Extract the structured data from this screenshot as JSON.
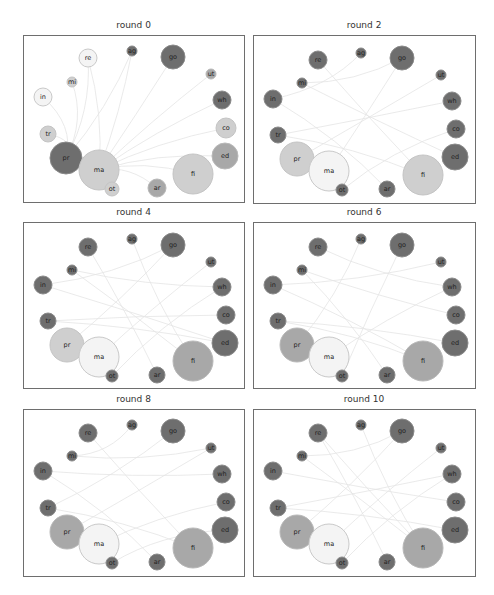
{
  "chart_data": {
    "type": "network-small-multiples",
    "title": "",
    "node_order": [
      "ag",
      "go",
      "ut",
      "wh",
      "co",
      "ed",
      "fi",
      "ar",
      "ot",
      "ma",
      "pr",
      "tr",
      "in",
      "mi",
      "re"
    ],
    "colors": {
      "dark": "#6e6e6e",
      "mid": "#a8a8a8",
      "light": "#cfcfcf",
      "white": "#f4f4f4"
    },
    "panels": [
      {
        "title": "round 0",
        "nodes": [
          {
            "id": "ag",
            "x": 108,
            "y": 15,
            "r": 5,
            "shade": "dark"
          },
          {
            "id": "go",
            "x": 149,
            "y": 21,
            "r": 12,
            "shade": "dark"
          },
          {
            "id": "re",
            "x": 64,
            "y": 22,
            "r": 9,
            "shade": "white"
          },
          {
            "id": "ut",
            "x": 187,
            "y": 38,
            "r": 5,
            "shade": "mid"
          },
          {
            "id": "mi",
            "x": 48,
            "y": 46,
            "r": 5,
            "shade": "light"
          },
          {
            "id": "in",
            "x": 19,
            "y": 61,
            "r": 9,
            "shade": "white"
          },
          {
            "id": "wh",
            "x": 198,
            "y": 64,
            "r": 9,
            "shade": "dark"
          },
          {
            "id": "co",
            "x": 202,
            "y": 92,
            "r": 10,
            "shade": "light"
          },
          {
            "id": "tr",
            "x": 24,
            "y": 98,
            "r": 8,
            "shade": "light"
          },
          {
            "id": "ed",
            "x": 201,
            "y": 120,
            "r": 13,
            "shade": "mid"
          },
          {
            "id": "pr",
            "x": 42,
            "y": 122,
            "r": 16,
            "shade": "dark"
          },
          {
            "id": "ma",
            "x": 75,
            "y": 134,
            "r": 20,
            "shade": "light"
          },
          {
            "id": "fi",
            "x": 169,
            "y": 138,
            "r": 20,
            "shade": "light"
          },
          {
            "id": "ot",
            "x": 88,
            "y": 153,
            "r": 7,
            "shade": "light"
          },
          {
            "id": "ar",
            "x": 133,
            "y": 152,
            "r": 9,
            "shade": "mid"
          }
        ],
        "edges": [
          [
            "pr",
            "re"
          ],
          [
            "pr",
            "in"
          ],
          [
            "pr",
            "mi"
          ],
          [
            "pr",
            "tr"
          ],
          [
            "ma",
            "ag"
          ],
          [
            "ma",
            "go"
          ],
          [
            "ma",
            "ut"
          ],
          [
            "ma",
            "wh"
          ],
          [
            "ma",
            "co"
          ],
          [
            "ma",
            "ed"
          ],
          [
            "ma",
            "fi"
          ],
          [
            "ma",
            "ar"
          ],
          [
            "ma",
            "ot"
          ],
          [
            "pr",
            "ag"
          ],
          [
            "ma",
            "re"
          ]
        ]
      },
      {
        "title": "round 2",
        "nodes": [
          {
            "id": "ag",
            "x": 107,
            "y": 17,
            "r": 5,
            "shade": "dark"
          },
          {
            "id": "go",
            "x": 148,
            "y": 22,
            "r": 12,
            "shade": "dark"
          },
          {
            "id": "re",
            "x": 64,
            "y": 24,
            "r": 9,
            "shade": "dark"
          },
          {
            "id": "ut",
            "x": 187,
            "y": 39,
            "r": 5,
            "shade": "dark"
          },
          {
            "id": "mi",
            "x": 48,
            "y": 47,
            "r": 5,
            "shade": "dark"
          },
          {
            "id": "in",
            "x": 19,
            "y": 63,
            "r": 9,
            "shade": "dark"
          },
          {
            "id": "wh",
            "x": 198,
            "y": 65,
            "r": 9,
            "shade": "dark"
          },
          {
            "id": "co",
            "x": 202,
            "y": 93,
            "r": 9,
            "shade": "dark"
          },
          {
            "id": "tr",
            "x": 24,
            "y": 99,
            "r": 8,
            "shade": "dark"
          },
          {
            "id": "ed",
            "x": 201,
            "y": 121,
            "r": 13,
            "shade": "dark"
          },
          {
            "id": "pr",
            "x": 43,
            "y": 123,
            "r": 17,
            "shade": "light"
          },
          {
            "id": "ma",
            "x": 75,
            "y": 135,
            "r": 20,
            "shade": "white"
          },
          {
            "id": "fi",
            "x": 169,
            "y": 139,
            "r": 20,
            "shade": "light"
          },
          {
            "id": "ot",
            "x": 88,
            "y": 154,
            "r": 6,
            "shade": "dark"
          },
          {
            "id": "ar",
            "x": 133,
            "y": 153,
            "r": 8,
            "shade": "dark"
          }
        ],
        "edges": [
          [
            "mi",
            "go"
          ],
          [
            "in",
            "ag"
          ],
          [
            "tr",
            "wh"
          ],
          [
            "ma",
            "go"
          ],
          [
            "pr",
            "ut"
          ],
          [
            "fi",
            "re"
          ],
          [
            "ot",
            "co"
          ],
          [
            "ar",
            "in"
          ],
          [
            "ed",
            "mi"
          ],
          [
            "tr",
            "fi"
          ]
        ]
      },
      {
        "title": "round 4",
        "nodes": [
          {
            "id": "ag",
            "x": 108,
            "y": 16,
            "r": 5,
            "shade": "dark"
          },
          {
            "id": "go",
            "x": 149,
            "y": 22,
            "r": 12,
            "shade": "dark"
          },
          {
            "id": "re",
            "x": 64,
            "y": 24,
            "r": 9,
            "shade": "dark"
          },
          {
            "id": "ut",
            "x": 187,
            "y": 39,
            "r": 5,
            "shade": "dark"
          },
          {
            "id": "mi",
            "x": 48,
            "y": 47,
            "r": 5,
            "shade": "dark"
          },
          {
            "id": "in",
            "x": 19,
            "y": 62,
            "r": 9,
            "shade": "dark"
          },
          {
            "id": "wh",
            "x": 198,
            "y": 64,
            "r": 9,
            "shade": "dark"
          },
          {
            "id": "co",
            "x": 202,
            "y": 92,
            "r": 9,
            "shade": "dark"
          },
          {
            "id": "tr",
            "x": 24,
            "y": 98,
            "r": 8,
            "shade": "dark"
          },
          {
            "id": "ed",
            "x": 201,
            "y": 120,
            "r": 13,
            "shade": "dark"
          },
          {
            "id": "pr",
            "x": 43,
            "y": 122,
            "r": 17,
            "shade": "light"
          },
          {
            "id": "ma",
            "x": 75,
            "y": 134,
            "r": 20,
            "shade": "white"
          },
          {
            "id": "fi",
            "x": 169,
            "y": 138,
            "r": 20,
            "shade": "mid"
          },
          {
            "id": "ot",
            "x": 88,
            "y": 153,
            "r": 6,
            "shade": "dark"
          },
          {
            "id": "ar",
            "x": 133,
            "y": 152,
            "r": 8,
            "shade": "dark"
          }
        ],
        "edges": [
          [
            "mi",
            "wh"
          ],
          [
            "in",
            "go"
          ],
          [
            "tr",
            "co"
          ],
          [
            "ma",
            "ut"
          ],
          [
            "pr",
            "go"
          ],
          [
            "fi",
            "mi"
          ],
          [
            "ot",
            "wh"
          ],
          [
            "ar",
            "re"
          ],
          [
            "ed",
            "in"
          ],
          [
            "tr",
            "ed"
          ],
          [
            "ag",
            "fi"
          ]
        ]
      },
      {
        "title": "round 6",
        "nodes": [
          {
            "id": "ag",
            "x": 107,
            "y": 16,
            "r": 5,
            "shade": "dark"
          },
          {
            "id": "go",
            "x": 148,
            "y": 22,
            "r": 12,
            "shade": "dark"
          },
          {
            "id": "re",
            "x": 64,
            "y": 24,
            "r": 9,
            "shade": "dark"
          },
          {
            "id": "ut",
            "x": 187,
            "y": 39,
            "r": 5,
            "shade": "dark"
          },
          {
            "id": "mi",
            "x": 48,
            "y": 47,
            "r": 5,
            "shade": "dark"
          },
          {
            "id": "in",
            "x": 19,
            "y": 62,
            "r": 9,
            "shade": "dark"
          },
          {
            "id": "wh",
            "x": 198,
            "y": 64,
            "r": 9,
            "shade": "dark"
          },
          {
            "id": "co",
            "x": 202,
            "y": 92,
            "r": 9,
            "shade": "dark"
          },
          {
            "id": "tr",
            "x": 24,
            "y": 98,
            "r": 8,
            "shade": "dark"
          },
          {
            "id": "ed",
            "x": 201,
            "y": 120,
            "r": 13,
            "shade": "dark"
          },
          {
            "id": "pr",
            "x": 43,
            "y": 122,
            "r": 17,
            "shade": "mid"
          },
          {
            "id": "ma",
            "x": 75,
            "y": 134,
            "r": 20,
            "shade": "white"
          },
          {
            "id": "fi",
            "x": 169,
            "y": 138,
            "r": 20,
            "shade": "mid"
          },
          {
            "id": "ot",
            "x": 88,
            "y": 153,
            "r": 6,
            "shade": "dark"
          },
          {
            "id": "ar",
            "x": 133,
            "y": 152,
            "r": 8,
            "shade": "dark"
          }
        ],
        "edges": [
          [
            "mi",
            "co"
          ],
          [
            "in",
            "ut"
          ],
          [
            "tr",
            "ed"
          ],
          [
            "ma",
            "wh"
          ],
          [
            "pr",
            "ag"
          ],
          [
            "fi",
            "in"
          ],
          [
            "ot",
            "go"
          ],
          [
            "ar",
            "mi"
          ],
          [
            "re",
            "wh"
          ],
          [
            "tr",
            "fi"
          ]
        ]
      },
      {
        "title": "round 8",
        "nodes": [
          {
            "id": "ag",
            "x": 108,
            "y": 15,
            "r": 5,
            "shade": "dark"
          },
          {
            "id": "go",
            "x": 149,
            "y": 21,
            "r": 12,
            "shade": "dark"
          },
          {
            "id": "re",
            "x": 64,
            "y": 23,
            "r": 9,
            "shade": "dark"
          },
          {
            "id": "ut",
            "x": 187,
            "y": 38,
            "r": 5,
            "shade": "dark"
          },
          {
            "id": "mi",
            "x": 48,
            "y": 46,
            "r": 5,
            "shade": "dark"
          },
          {
            "id": "in",
            "x": 19,
            "y": 61,
            "r": 9,
            "shade": "dark"
          },
          {
            "id": "wh",
            "x": 198,
            "y": 64,
            "r": 9,
            "shade": "dark"
          },
          {
            "id": "co",
            "x": 202,
            "y": 92,
            "r": 9,
            "shade": "dark"
          },
          {
            "id": "tr",
            "x": 24,
            "y": 98,
            "r": 8,
            "shade": "dark"
          },
          {
            "id": "ed",
            "x": 201,
            "y": 120,
            "r": 13,
            "shade": "dark"
          },
          {
            "id": "pr",
            "x": 43,
            "y": 122,
            "r": 17,
            "shade": "mid"
          },
          {
            "id": "ma",
            "x": 75,
            "y": 134,
            "r": 20,
            "shade": "white"
          },
          {
            "id": "fi",
            "x": 169,
            "y": 138,
            "r": 20,
            "shade": "mid"
          },
          {
            "id": "ot",
            "x": 88,
            "y": 153,
            "r": 6,
            "shade": "dark"
          },
          {
            "id": "ar",
            "x": 133,
            "y": 152,
            "r": 8,
            "shade": "dark"
          }
        ],
        "edges": [
          [
            "mi",
            "ut"
          ],
          [
            "in",
            "wh"
          ],
          [
            "tr",
            "go"
          ],
          [
            "ma",
            "co"
          ],
          [
            "pr",
            "ut"
          ],
          [
            "fi",
            "re"
          ],
          [
            "ot",
            "ed"
          ],
          [
            "ar",
            "in"
          ],
          [
            "ag",
            "mi"
          ],
          [
            "tr",
            "fi"
          ]
        ]
      },
      {
        "title": "round 10",
        "nodes": [
          {
            "id": "ag",
            "x": 107,
            "y": 15,
            "r": 5,
            "shade": "dark"
          },
          {
            "id": "go",
            "x": 148,
            "y": 21,
            "r": 12,
            "shade": "dark"
          },
          {
            "id": "re",
            "x": 64,
            "y": 23,
            "r": 9,
            "shade": "dark"
          },
          {
            "id": "ut",
            "x": 187,
            "y": 38,
            "r": 5,
            "shade": "dark"
          },
          {
            "id": "mi",
            "x": 48,
            "y": 46,
            "r": 5,
            "shade": "dark"
          },
          {
            "id": "in",
            "x": 19,
            "y": 61,
            "r": 9,
            "shade": "dark"
          },
          {
            "id": "wh",
            "x": 198,
            "y": 64,
            "r": 9,
            "shade": "dark"
          },
          {
            "id": "co",
            "x": 202,
            "y": 92,
            "r": 9,
            "shade": "dark"
          },
          {
            "id": "tr",
            "x": 24,
            "y": 98,
            "r": 8,
            "shade": "dark"
          },
          {
            "id": "ed",
            "x": 201,
            "y": 120,
            "r": 13,
            "shade": "dark"
          },
          {
            "id": "pr",
            "x": 43,
            "y": 122,
            "r": 17,
            "shade": "mid"
          },
          {
            "id": "ma",
            "x": 75,
            "y": 134,
            "r": 20,
            "shade": "white"
          },
          {
            "id": "fi",
            "x": 169,
            "y": 138,
            "r": 20,
            "shade": "mid"
          },
          {
            "id": "ot",
            "x": 88,
            "y": 153,
            "r": 6,
            "shade": "dark"
          },
          {
            "id": "ar",
            "x": 133,
            "y": 152,
            "r": 8,
            "shade": "dark"
          }
        ],
        "edges": [
          [
            "mi",
            "go"
          ],
          [
            "in",
            "co"
          ],
          [
            "tr",
            "wh"
          ],
          [
            "ma",
            "ut"
          ],
          [
            "pr",
            "go"
          ],
          [
            "fi",
            "mi"
          ],
          [
            "ot",
            "wh"
          ],
          [
            "ar",
            "re"
          ],
          [
            "ag",
            "fi"
          ],
          [
            "tr",
            "ed"
          ],
          [
            "re",
            "fi"
          ]
        ]
      }
    ]
  }
}
